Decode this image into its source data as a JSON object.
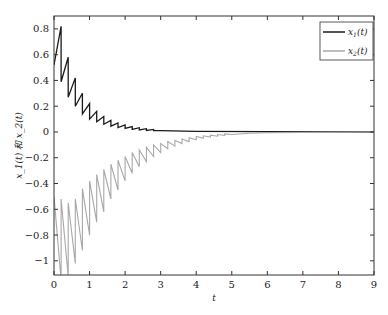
{
  "chart_data": {
    "type": "line",
    "title": "",
    "xlabel": "t",
    "ylabel": "x_1(t) 和 x_2(t)",
    "xlim": [
      0,
      9
    ],
    "ylim": [
      -1.11,
      0.9
    ],
    "grid": false,
    "legend_position": "upper right",
    "xticks": [
      0,
      1,
      2,
      3,
      4,
      5,
      6,
      7,
      8,
      9
    ],
    "xtick_labels": [
      "0",
      "1",
      "2",
      "3",
      "4",
      "5",
      "6",
      "7",
      "8",
      "9"
    ],
    "yticks": [
      -1,
      -0.8,
      -0.6,
      -0.4,
      -0.2,
      0,
      0.2,
      0.4,
      0.6,
      0.8
    ],
    "ytick_labels": [
      "−1",
      "−0.8",
      "−0.6",
      "−0.4",
      "−0.2",
      "0",
      "0.2",
      "0.4",
      "0.6",
      "0.8"
    ],
    "series": [
      {
        "name": "x1(t)",
        "legend_label": "x",
        "legend_sub": "1",
        "legend_suffix": "(t)",
        "color": "#1a1a1a",
        "description": "sawtooth impulsive decay from ~0.5 at t=0 with peaks ~0.82, 0.58, 0.42, 0.30... converging to 0 by t≈3",
        "x": [
          0,
          0.2,
          0.2,
          0.4,
          0.4,
          0.6,
          0.6,
          0.8,
          0.8,
          1.0,
          1.0,
          1.2,
          1.2,
          1.4,
          1.4,
          1.6,
          1.6,
          1.8,
          1.8,
          2.0,
          2.0,
          2.2,
          2.2,
          2.4,
          2.4,
          2.6,
          2.6,
          2.8,
          2.8,
          3.0,
          4.0,
          6.0,
          9.0
        ],
        "values": [
          0.52,
          0.82,
          0.39,
          0.58,
          0.27,
          0.42,
          0.2,
          0.3,
          0.14,
          0.22,
          0.1,
          0.16,
          0.08,
          0.12,
          0.06,
          0.09,
          0.045,
          0.07,
          0.035,
          0.055,
          0.027,
          0.042,
          0.02,
          0.033,
          0.015,
          0.025,
          0.012,
          0.02,
          0.01,
          0.01,
          0.005,
          0.002,
          0.0
        ]
      },
      {
        "name": "x2(t)",
        "legend_label": "x",
        "legend_sub": "2",
        "legend_suffix": "(t)",
        "color": "#a8a8a8",
        "description": "sawtooth impulsive rise from ~-0.5 with troughs below -1.1, converging to 0 by t≈5.5",
        "x": [
          0,
          0.2,
          0.2,
          0.4,
          0.4,
          0.6,
          0.6,
          0.8,
          0.8,
          1.0,
          1.0,
          1.2,
          1.2,
          1.4,
          1.4,
          1.6,
          1.6,
          1.8,
          1.8,
          2.0,
          2.0,
          2.2,
          2.2,
          2.4,
          2.4,
          2.6,
          2.6,
          2.8,
          2.8,
          3.0,
          3.0,
          3.2,
          3.2,
          3.4,
          3.4,
          3.6,
          3.6,
          3.8,
          3.8,
          4.0,
          4.0,
          4.2,
          4.2,
          4.4,
          4.4,
          4.6,
          4.6,
          4.8,
          4.8,
          5.0,
          5.5,
          6.0,
          9.0
        ],
        "values": [
          -0.5,
          -1.15,
          -0.52,
          -1.12,
          -0.55,
          -1.02,
          -0.52,
          -0.92,
          -0.44,
          -0.8,
          -0.38,
          -0.7,
          -0.33,
          -0.62,
          -0.29,
          -0.52,
          -0.25,
          -0.45,
          -0.22,
          -0.38,
          -0.19,
          -0.32,
          -0.16,
          -0.27,
          -0.14,
          -0.23,
          -0.12,
          -0.19,
          -0.1,
          -0.16,
          -0.09,
          -0.13,
          -0.075,
          -0.11,
          -0.065,
          -0.09,
          -0.055,
          -0.075,
          -0.045,
          -0.06,
          -0.035,
          -0.05,
          -0.03,
          -0.04,
          -0.025,
          -0.033,
          -0.02,
          -0.026,
          -0.015,
          -0.02,
          -0.01,
          -0.005,
          0.0
        ]
      }
    ]
  }
}
